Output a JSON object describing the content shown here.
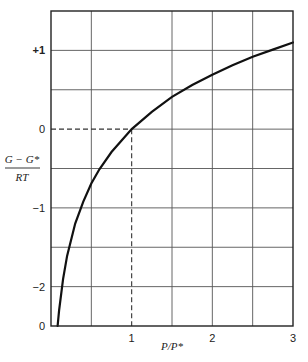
{
  "chart_data": {
    "type": "line",
    "title": "",
    "xlabel": "P/P*",
    "ylabel_numerator": "G − G*",
    "ylabel_denominator": "RT",
    "ylabel": "(G − G*)/RT",
    "xlim": [
      0,
      3
    ],
    "ylim": [
      -2.5,
      1.5
    ],
    "grid": true,
    "x_grid_step": 0.5,
    "y_grid_step": 0.5,
    "x_ticks": [
      {
        "value": 1,
        "label": "1"
      },
      {
        "value": 2,
        "label": "2"
      },
      {
        "value": 3,
        "label": "3"
      }
    ],
    "y_ticks": [
      {
        "value": 1,
        "label": "+1"
      },
      {
        "value": 0,
        "label": "0"
      },
      {
        "value": -1,
        "label": "−1"
      },
      {
        "value": -2,
        "label": "−2"
      }
    ],
    "origin_label": "0",
    "function": "ln(P/P*)",
    "series": [
      {
        "name": "(G − G*)/RT = ln(P/P*)",
        "x": [
          0.082,
          0.1,
          0.15,
          0.2,
          0.3,
          0.4,
          0.5,
          0.6,
          0.75,
          1.0,
          1.25,
          1.5,
          1.75,
          2.0,
          2.25,
          2.5,
          2.75,
          3.0
        ],
        "values": [
          -2.5,
          -2.3,
          -1.9,
          -1.61,
          -1.2,
          -0.92,
          -0.69,
          -0.51,
          -0.29,
          0.0,
          0.22,
          0.41,
          0.56,
          0.69,
          0.81,
          0.92,
          1.01,
          1.1
        ]
      }
    ],
    "annotations": [
      {
        "type": "dashed-guide",
        "from": [
          0,
          0
        ],
        "to": [
          1,
          0
        ]
      },
      {
        "type": "dashed-guide",
        "from": [
          1,
          0
        ],
        "to": [
          1,
          -2.5
        ]
      }
    ],
    "legend": null
  }
}
